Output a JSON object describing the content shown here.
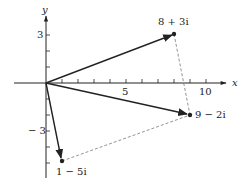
{
  "diagram": {
    "type": "complex-plane-vector-addition",
    "axes": {
      "x_label": "x",
      "y_label": "y",
      "x_tick_labels": [
        {
          "value": 5,
          "text": "5"
        },
        {
          "value": 10,
          "text": "10"
        }
      ],
      "y_tick_labels": [
        {
          "value": 3,
          "text": "3"
        },
        {
          "value": -3,
          "text": "− 3"
        }
      ],
      "x_ticks": [
        1,
        2,
        3,
        4,
        5,
        6,
        7,
        8,
        9,
        10
      ],
      "y_ticks": [
        3,
        2,
        1,
        -1,
        -2,
        -3,
        -4,
        -5
      ]
    },
    "points": [
      {
        "re": 8,
        "im": 3,
        "label": "8 + 3i"
      },
      {
        "re": 9,
        "im": -2,
        "label": "9 − 2i"
      },
      {
        "re": 1,
        "im": -5,
        "label": "1 − 5i"
      }
    ],
    "vectors": [
      {
        "from": "origin",
        "to": "8 + 3i",
        "style": "solid-arrow"
      },
      {
        "from": "origin",
        "to": "9 − 2i",
        "style": "solid-arrow"
      },
      {
        "from": "origin",
        "to": "1 − 5i",
        "style": "solid-arrow"
      }
    ],
    "dashed_lines": [
      {
        "from": "8 + 3i",
        "to": "9 − 2i"
      },
      {
        "from": "1 − 5i",
        "to": "9 − 2i"
      }
    ],
    "colors": {
      "ink": "#222222",
      "dashed": "#777777",
      "background": "#ffffff"
    }
  },
  "labels": {
    "x_axis": "x",
    "y_axis": "y",
    "tick_5": "5",
    "tick_10": "10",
    "tick_3": "3",
    "tick_neg3": "− 3",
    "p1": "8 + 3i",
    "p2": "9 − 2i",
    "p3": "1 − 5i"
  }
}
